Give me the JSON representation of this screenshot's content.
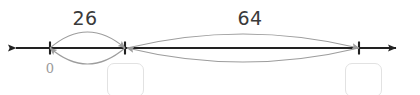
{
  "page": {
    "width": 420,
    "height": 95,
    "background_color": "#ffffff"
  },
  "number_line": {
    "axis_color": "#222222",
    "arc_color": "#9d9d9d",
    "y": 48,
    "left_arrow_x": 8,
    "right_arrow_x": 404,
    "ticks": [
      {
        "name": "tick-zero",
        "x": 50,
        "label": "0",
        "label_color": "#9a9a9a",
        "label_y": 62
      },
      {
        "name": "tick-middle",
        "x": 125,
        "label": "",
        "label_color": "#9a9a9a",
        "label_y": 62
      },
      {
        "name": "tick-right",
        "x": 359,
        "label": "",
        "label_color": "#9a9a9a",
        "label_y": 62
      }
    ]
  },
  "spans": [
    {
      "name": "span-26",
      "label": "26",
      "label_x": 85,
      "label_y": 9,
      "from_x": 50,
      "to_x": 125,
      "bulge": 16,
      "label_color": "#3a3a3a"
    },
    {
      "name": "span-64",
      "label": "64",
      "label_x": 250,
      "label_y": 9,
      "from_x": 127,
      "to_x": 359,
      "bulge": 14,
      "label_color": "#3a3a3a"
    }
  ],
  "answer_boxes": [
    {
      "name": "answer-box-left",
      "value": "",
      "placeholder": "",
      "x": 107,
      "y": 63,
      "width": 37,
      "height": 34,
      "border_color": "#e2e2e2"
    },
    {
      "name": "answer-box-right",
      "value": "",
      "placeholder": "",
      "x": 345,
      "y": 63,
      "width": 37,
      "height": 34,
      "border_color": "#e2e2e2"
    }
  ]
}
